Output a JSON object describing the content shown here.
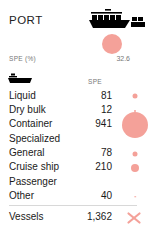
{
  "card": {
    "title": "PORT",
    "header_icon": "container-ship-icon",
    "accent_color": "#f4a199",
    "text_color": "#1a1a1a",
    "muted_color": "#777777"
  },
  "summary": {
    "metric_label": "SPE (%)",
    "metric_value": "32.6",
    "dot_icon": "spe-circle-marker"
  },
  "table": {
    "row_icon": "tanker-ship-icon",
    "value_column_header": "SPE",
    "rows": [
      {
        "label": "Liquid",
        "value": "81",
        "dot_size": 5
      },
      {
        "label": "Dry bulk",
        "value": "12",
        "dot_size": 2
      },
      {
        "label": "Container",
        "value": "941",
        "dot_size": 26
      },
      {
        "label": "Specialized",
        "value": "",
        "dot_size": 0
      },
      {
        "label": "General",
        "value": "78",
        "dot_size": 5
      },
      {
        "label": "Cruise ship",
        "value": "210",
        "dot_size": 8
      },
      {
        "label": "Passenger",
        "value": "",
        "dot_size": 0
      },
      {
        "label": "Other",
        "value": "40",
        "dot_size": 1.5
      }
    ]
  },
  "footer": {
    "label": "Vessels",
    "value": "1,362",
    "mark_icon": "x-cross-marker"
  }
}
